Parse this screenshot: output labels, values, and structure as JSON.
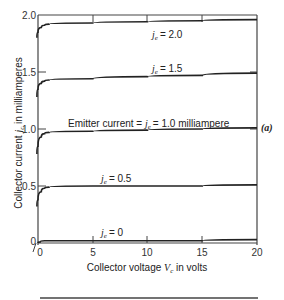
{
  "chart_data": {
    "type": "line",
    "title": "",
    "xlabel": "Collector voltage V_c in volts",
    "ylabel": "Collector current j_c in milliamperes",
    "xlim": [
      0,
      20
    ],
    "ylim": [
      0,
      2.0
    ],
    "xticks": [
      "0",
      "5",
      "10",
      "15",
      "20"
    ],
    "yticks": [
      "0",
      "0.5",
      "1.0",
      "1.5",
      "2.0"
    ],
    "grid": false,
    "panel_label": "(a)",
    "series": [
      {
        "name": "j_e = 0",
        "label": "je = 0",
        "x": [
          0,
          0.2,
          0.6,
          1,
          5,
          10,
          15,
          20
        ],
        "y": [
          0,
          0.01,
          0.02,
          0.02,
          0.02,
          0.02,
          0.02,
          0.03
        ]
      },
      {
        "name": "j_e = 0.5",
        "label": "je = 0.5",
        "x": [
          -0.1,
          0,
          0.3,
          0.6,
          1,
          5,
          10,
          15,
          20
        ],
        "y": [
          0.32,
          0.38,
          0.45,
          0.48,
          0.49,
          0.5,
          0.5,
          0.5,
          0.51
        ]
      },
      {
        "name": "j_e = 1.0",
        "label": "Emitter current = je = 1.0 milliampere",
        "x": [
          -0.1,
          0,
          0.3,
          0.6,
          1,
          5,
          10,
          15,
          20
        ],
        "y": [
          0.78,
          0.85,
          0.93,
          0.96,
          0.97,
          0.98,
          0.99,
          1.0,
          1.01
        ]
      },
      {
        "name": "j_e = 1.5",
        "label": "je = 1.5",
        "x": [
          -0.1,
          0,
          0.3,
          0.6,
          1,
          5,
          10,
          15,
          20
        ],
        "y": [
          1.28,
          1.35,
          1.4,
          1.42,
          1.43,
          1.44,
          1.46,
          1.47,
          1.49
        ]
      },
      {
        "name": "j_e = 2.0",
        "label": "je = 2.0",
        "x": [
          -0.1,
          0,
          0.3,
          0.6,
          1,
          5,
          10,
          15,
          20
        ],
        "y": [
          1.8,
          1.85,
          1.89,
          1.91,
          1.92,
          1.93,
          1.94,
          1.95,
          1.96
        ]
      }
    ]
  },
  "labels": {
    "je": "j",
    "je_sub": "e",
    "curve_20": "= 2.0",
    "curve_15": "= 1.5",
    "curve_10_prefix": "Emitter current = ",
    "curve_10_suffix": "= 1.0 milliampere",
    "curve_05": "= 0.5",
    "curve_00": "= 0",
    "panel": "(a)",
    "ylabel_prefix": "Collector current ",
    "ylabel_var": "j",
    "ylabel_sub": "c",
    "ylabel_suffix": " in milliamperes",
    "xlabel_prefix": "Collector voltage ",
    "xlabel_var": "V",
    "xlabel_sub": "c",
    "xlabel_suffix": " in volts"
  }
}
